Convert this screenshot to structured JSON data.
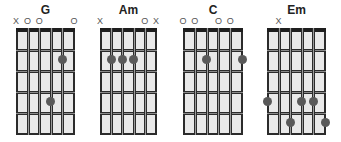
{
  "colors": {
    "frame": "#2b2b2b",
    "fill": "#e9e9e9",
    "dot": "#595959",
    "marker": "#555555"
  },
  "chords": [
    {
      "name": "G",
      "markers": [
        "X",
        "O",
        "O",
        "",
        "",
        "O"
      ],
      "dots": [
        {
          "string": 5,
          "fret": 2
        },
        {
          "string": 4,
          "fret": 4
        }
      ]
    },
    {
      "name": "Am",
      "markers": [
        "X",
        "",
        "",
        "",
        "O",
        "X"
      ],
      "dots": [
        {
          "string": 2,
          "fret": 2
        },
        {
          "string": 3,
          "fret": 2
        },
        {
          "string": 4,
          "fret": 2
        }
      ]
    },
    {
      "name": "C",
      "markers": [
        "O",
        "O",
        "",
        "O",
        "O",
        ""
      ],
      "dots": [
        {
          "string": 3,
          "fret": 2
        },
        {
          "string": 6,
          "fret": 2
        }
      ]
    },
    {
      "name": "Em",
      "markers": [
        "",
        "X",
        "",
        "",
        "",
        ""
      ],
      "dots": [
        {
          "string": 1,
          "fret": 4
        },
        {
          "string": 4,
          "fret": 4
        },
        {
          "string": 5,
          "fret": 4
        },
        {
          "string": 3,
          "fret": 5
        },
        {
          "string": 6,
          "fret": 5
        }
      ]
    }
  ],
  "frets_shown": 5,
  "strings": 6
}
